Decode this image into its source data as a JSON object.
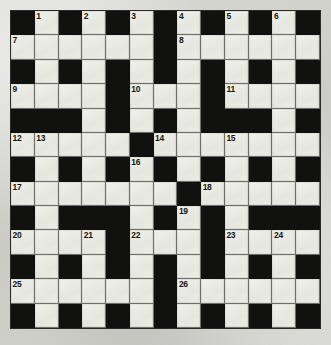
{
  "puzzle": {
    "kind": "crossword-grid",
    "title": "Crossword",
    "columns": 13,
    "rows": 13,
    "colors": {
      "block": "#111110",
      "cell": "#ececE6",
      "grid_line": "#6f6f69",
      "paper": "#d2d2cd",
      "number_text": "#16160f"
    },
    "legend": {
      "white_symbol": "W",
      "black_symbol": "B"
    },
    "grid": [
      [
        "B",
        "W",
        "B",
        "W",
        "B",
        "W",
        "B",
        "W",
        "B",
        "W",
        "B",
        "W",
        "B"
      ],
      [
        "W",
        "W",
        "W",
        "W",
        "W",
        "W",
        "B",
        "W",
        "W",
        "W",
        "W",
        "W",
        "W"
      ],
      [
        "B",
        "W",
        "B",
        "W",
        "B",
        "W",
        "B",
        "W",
        "B",
        "W",
        "B",
        "W",
        "B"
      ],
      [
        "W",
        "W",
        "W",
        "W",
        "B",
        "W",
        "W",
        "W",
        "B",
        "W",
        "W",
        "W",
        "W"
      ],
      [
        "B",
        "B",
        "B",
        "W",
        "B",
        "W",
        "B",
        "W",
        "B",
        "B",
        "B",
        "W",
        "B"
      ],
      [
        "W",
        "W",
        "W",
        "W",
        "W",
        "B",
        "W",
        "W",
        "W",
        "W",
        "W",
        "W",
        "W"
      ],
      [
        "B",
        "W",
        "B",
        "W",
        "B",
        "W",
        "B",
        "W",
        "B",
        "W",
        "B",
        "W",
        "B"
      ],
      [
        "W",
        "W",
        "W",
        "W",
        "W",
        "W",
        "W",
        "B",
        "W",
        "W",
        "W",
        "W",
        "W"
      ],
      [
        "B",
        "W",
        "B",
        "B",
        "B",
        "W",
        "B",
        "W",
        "B",
        "W",
        "B",
        "B",
        "B"
      ],
      [
        "W",
        "W",
        "W",
        "W",
        "B",
        "W",
        "W",
        "W",
        "B",
        "W",
        "W",
        "W",
        "W"
      ],
      [
        "B",
        "W",
        "B",
        "W",
        "B",
        "W",
        "B",
        "W",
        "B",
        "W",
        "B",
        "W",
        "B"
      ],
      [
        "W",
        "W",
        "W",
        "W",
        "W",
        "W",
        "B",
        "W",
        "W",
        "W",
        "W",
        "W",
        "W"
      ],
      [
        "B",
        "W",
        "B",
        "W",
        "B",
        "W",
        "B",
        "W",
        "B",
        "W",
        "B",
        "W",
        "B"
      ]
    ],
    "numbers": [
      {
        "row": 1,
        "col": 2,
        "label": "1"
      },
      {
        "row": 1,
        "col": 4,
        "label": "2"
      },
      {
        "row": 1,
        "col": 6,
        "label": "3"
      },
      {
        "row": 1,
        "col": 8,
        "label": "4"
      },
      {
        "row": 1,
        "col": 10,
        "label": "5"
      },
      {
        "row": 1,
        "col": 12,
        "label": "6"
      },
      {
        "row": 2,
        "col": 1,
        "label": "7"
      },
      {
        "row": 2,
        "col": 8,
        "label": "8"
      },
      {
        "row": 4,
        "col": 1,
        "label": "9"
      },
      {
        "row": 4,
        "col": 6,
        "label": "10"
      },
      {
        "row": 4,
        "col": 10,
        "label": "11"
      },
      {
        "row": 6,
        "col": 1,
        "label": "12"
      },
      {
        "row": 6,
        "col": 2,
        "label": "13"
      },
      {
        "row": 6,
        "col": 7,
        "label": "14"
      },
      {
        "row": 6,
        "col": 10,
        "label": "15"
      },
      {
        "row": 7,
        "col": 6,
        "label": "16"
      },
      {
        "row": 8,
        "col": 1,
        "label": "17"
      },
      {
        "row": 8,
        "col": 9,
        "label": "18"
      },
      {
        "row": 9,
        "col": 8,
        "label": "19"
      },
      {
        "row": 10,
        "col": 1,
        "label": "20"
      },
      {
        "row": 10,
        "col": 4,
        "label": "21"
      },
      {
        "row": 10,
        "col": 6,
        "label": "22"
      },
      {
        "row": 10,
        "col": 10,
        "label": "23"
      },
      {
        "row": 10,
        "col": 12,
        "label": "24"
      },
      {
        "row": 12,
        "col": 1,
        "label": "25"
      },
      {
        "row": 12,
        "col": 8,
        "label": "26"
      }
    ]
  }
}
